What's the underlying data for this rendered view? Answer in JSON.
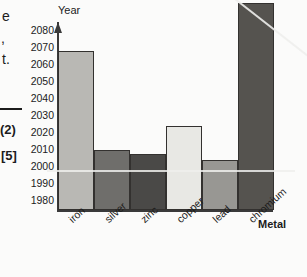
{
  "margin_notes": {
    "line_1": "e",
    "line_2": ",",
    "line_3": "t.",
    "marks_1": "(2)",
    "marks_2": "[5]"
  },
  "chart_data": {
    "type": "bar",
    "title": "",
    "xlabel": "Metal",
    "ylabel": "Year",
    "categories": [
      "iron",
      "silver",
      "zinc",
      "copper",
      "lead",
      "chromium"
    ],
    "values": [
      2068,
      2010,
      2008,
      2024,
      2004,
      2096
    ],
    "value_notes": {
      "chromium": "bar extends above the top of the plotted axis (beyond 2080)"
    },
    "ylim": [
      1975,
      2085
    ],
    "yticks": [
      1980,
      1990,
      2000,
      2010,
      2020,
      2030,
      2040,
      2050,
      2060,
      2070,
      2080
    ],
    "ytick_labels": [
      "1980",
      "1990",
      "2000",
      "2010",
      "2020",
      "2030",
      "2040",
      "2050",
      "2060",
      "2070",
      "2080"
    ],
    "grid": false,
    "legend": null,
    "bar_colors": [
      "#b9b8b4",
      "#6f6e6b",
      "#4a4947",
      "#e8e8e4",
      "#989793",
      "#55534f"
    ]
  }
}
